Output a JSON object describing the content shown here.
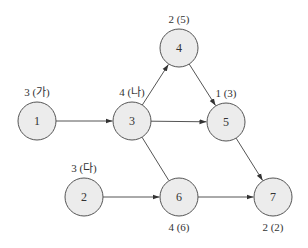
{
  "diagram": {
    "type": "activity-network",
    "nodes": [
      {
        "id": "1",
        "x": 37,
        "y": 121,
        "label": "3 (가)",
        "label_pos": "above"
      },
      {
        "id": "2",
        "x": 84,
        "y": 197,
        "label": "3 (다)",
        "label_pos": "above"
      },
      {
        "id": "3",
        "x": 132,
        "y": 121,
        "label": "4 (나)",
        "label_pos": "above"
      },
      {
        "id": "4",
        "x": 179,
        "y": 48,
        "label": "2 (5)",
        "label_pos": "above"
      },
      {
        "id": "5",
        "x": 226,
        "y": 122,
        "label": "1 (3)",
        "label_pos": "above"
      },
      {
        "id": "6",
        "x": 179,
        "y": 197,
        "label": "4 (6)",
        "label_pos": "below"
      },
      {
        "id": "7",
        "x": 273,
        "y": 197,
        "label": "2 (2)",
        "label_pos": "below"
      }
    ],
    "edges": [
      {
        "from": "1",
        "to": "3",
        "arrow": true
      },
      {
        "from": "3",
        "to": "4",
        "arrow": true
      },
      {
        "from": "3",
        "to": "5",
        "arrow": true
      },
      {
        "from": "3",
        "to": "6",
        "arrow": false
      },
      {
        "from": "4",
        "to": "5",
        "arrow": true
      },
      {
        "from": "2",
        "to": "6",
        "arrow": true
      },
      {
        "from": "5",
        "to": "7",
        "arrow": true
      },
      {
        "from": "6",
        "to": "7",
        "arrow": true
      }
    ],
    "node_radius": 19,
    "colors": {
      "node_fill": "#ececec",
      "stroke": "#555555",
      "text": "#333333"
    }
  }
}
